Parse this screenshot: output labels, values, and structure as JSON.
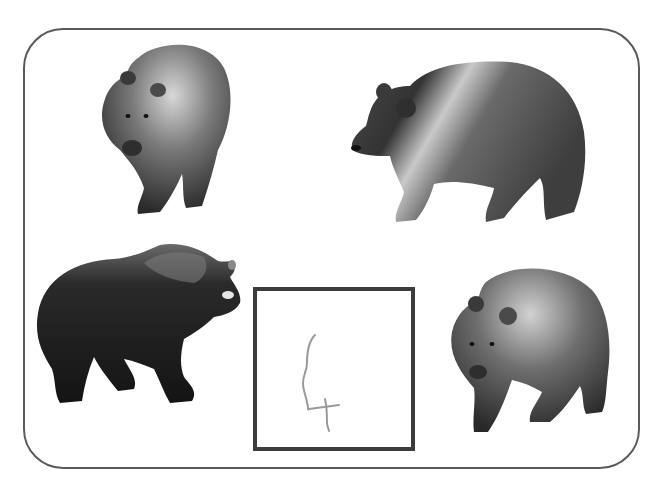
{
  "worksheet": {
    "task": "count-the-bears",
    "frame": {
      "border_color": "#5a5a5a"
    },
    "items": [
      {
        "label": "bear",
        "pose": "walking toward viewer",
        "position": "top-left"
      },
      {
        "label": "bear",
        "pose": "walking left, side view",
        "position": "top-right"
      },
      {
        "label": "bear",
        "pose": "standing right, side view, dark",
        "position": "bottom-left"
      },
      {
        "label": "bear",
        "pose": "walking toward viewer, three-quarter",
        "position": "bottom-right"
      }
    ],
    "answer_box": {
      "handwritten_answer": "4",
      "border_color": "#3c3c3c",
      "ink_color": "#9a9a9a"
    }
  }
}
